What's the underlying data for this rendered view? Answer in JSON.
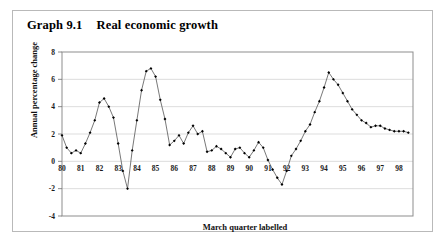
{
  "title": {
    "number": "Graph 9.1",
    "text": "Real economic growth"
  },
  "caption": "March quarter labelled",
  "chart_data": {
    "type": "line",
    "title": "Real economic growth",
    "subtitle": "Graph 9.1",
    "xlabel": "March quarter labelled",
    "ylabel": "Annual percentage change",
    "ylim": [
      -4,
      8
    ],
    "yticks": [
      -4,
      -2,
      0,
      2,
      4,
      6,
      8
    ],
    "ytick_labels": [
      "-4",
      "-2",
      "0",
      "2",
      "4",
      "6",
      "8"
    ],
    "xlim": [
      1980,
      1998.75
    ],
    "xticks": [
      1980,
      1981,
      1982,
      1983,
      1984,
      1985,
      1986,
      1987,
      1988,
      1989,
      1990,
      1991,
      1992,
      1993,
      1994,
      1995,
      1996,
      1997,
      1998
    ],
    "xtick_labels": [
      "80",
      "81",
      "82",
      "83",
      "84",
      "85",
      "86",
      "87",
      "88",
      "89",
      "90",
      "91",
      "92",
      "93",
      "94",
      "95",
      "96",
      "97",
      "98"
    ],
    "grid": "horizontal",
    "legend": "none",
    "marker": "filled-diamond",
    "line_color": "#555555",
    "marker_color": "#000000",
    "x": [
      1980,
      1980.25,
      1980.5,
      1980.75,
      1981,
      1981.25,
      1981.5,
      1981.75,
      1982,
      1982.25,
      1982.5,
      1982.75,
      1983,
      1983.25,
      1983.5,
      1983.75,
      1984,
      1984.25,
      1984.5,
      1984.75,
      1985,
      1985.25,
      1985.5,
      1985.75,
      1986,
      1986.25,
      1986.5,
      1986.75,
      1987,
      1987.25,
      1987.5,
      1987.75,
      1988,
      1988.25,
      1988.5,
      1988.75,
      1989,
      1989.25,
      1989.5,
      1989.75,
      1990,
      1990.25,
      1990.5,
      1990.75,
      1991,
      1991.25,
      1991.5,
      1991.75,
      1992,
      1992.25,
      1992.5,
      1992.75,
      1993,
      1993.25,
      1993.5,
      1993.75,
      1994,
      1994.25,
      1994.5,
      1994.75,
      1995,
      1995.25,
      1995.5,
      1995.75,
      1996,
      1996.25,
      1996.5,
      1996.75,
      1997,
      1997.25,
      1997.5,
      1997.75,
      1998,
      1998.25,
      1998.5
    ],
    "y": [
      1.9,
      1.0,
      0.6,
      0.8,
      0.6,
      1.3,
      2.1,
      3.0,
      4.3,
      4.6,
      4.0,
      3.2,
      1.3,
      -0.7,
      -2.0,
      0.8,
      3.0,
      5.2,
      6.6,
      6.8,
      6.2,
      4.5,
      3.1,
      1.2,
      1.5,
      1.9,
      1.3,
      2.1,
      2.6,
      2.0,
      2.2,
      0.7,
      0.8,
      1.1,
      0.9,
      0.6,
      0.3,
      0.9,
      1.0,
      0.6,
      0.3,
      0.8,
      1.4,
      1.0,
      0.1,
      -0.6,
      -1.2,
      -1.7,
      -0.7,
      0.4,
      0.9,
      1.5,
      2.2,
      2.7,
      3.6,
      4.4,
      5.4,
      6.5,
      6.0,
      5.6,
      5.0,
      4.4,
      3.8,
      3.4,
      3.0,
      2.8,
      2.5,
      2.6,
      2.6,
      2.4,
      2.3,
      2.2,
      2.2,
      2.2,
      2.1
    ],
    "values_note": "Annual percentage change, quarterly observations 1980 Q1 - 1998 Q3"
  }
}
